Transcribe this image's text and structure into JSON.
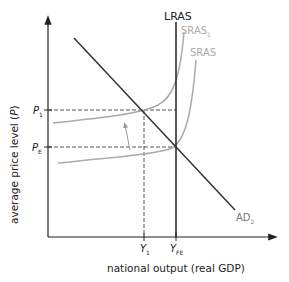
{
  "diagram": {
    "type": "AD-AS economics diagram",
    "y_axis_label": "average price level (",
    "y_axis_var": "P",
    "y_axis_close": ")",
    "x_axis_label": "national output (real GDP)",
    "curves": {
      "lras": "LRAS",
      "sras1_main": "SRAS",
      "sras1_sub": "1",
      "sras": "SRAS",
      "ad_main": "AD",
      "ad_sub": "2"
    },
    "price_levels": {
      "p1_main": "P",
      "p1_sub": "1",
      "pe_main": "P",
      "pe_sub": "E"
    },
    "outputs": {
      "y1_main": "Y",
      "y1_sub": "1",
      "yfe_main": "Y",
      "yfe_sub": "FE"
    },
    "colors": {
      "axis": "#222222",
      "ad": "#333333",
      "lras": "#222222",
      "sras": "#aaaaaa",
      "dashed": "#555555",
      "label_grey": "#aaaaaa"
    }
  }
}
